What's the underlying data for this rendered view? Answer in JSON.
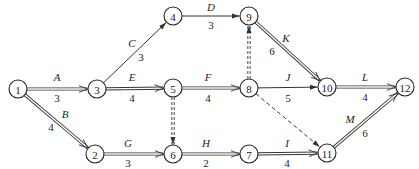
{
  "diagram": {
    "type": "activity-on-arrow network",
    "nodes": [
      {
        "id": "1",
        "x": 18,
        "y": 89
      },
      {
        "id": "2",
        "x": 95,
        "y": 154
      },
      {
        "id": "3",
        "x": 97,
        "y": 89
      },
      {
        "id": "4",
        "x": 173,
        "y": 16
      },
      {
        "id": "5",
        "x": 173,
        "y": 88
      },
      {
        "id": "6",
        "x": 173,
        "y": 154
      },
      {
        "id": "7",
        "x": 249,
        "y": 154
      },
      {
        "id": "8",
        "x": 249,
        "y": 88
      },
      {
        "id": "9",
        "x": 249,
        "y": 16
      },
      {
        "id": "10",
        "x": 327,
        "y": 87
      },
      {
        "id": "11",
        "x": 327,
        "y": 153
      },
      {
        "id": "12",
        "x": 405,
        "y": 87
      }
    ],
    "activities": [
      {
        "name": "A",
        "duration": "3",
        "from": "1",
        "to": "3",
        "style": "double",
        "name_pos": [
          57,
          81
        ],
        "dur_pos": [
          57,
          102
        ]
      },
      {
        "name": "B",
        "duration": "4",
        "from": "1",
        "to": "2",
        "style": "double",
        "name_pos": [
          65,
          118
        ],
        "dur_pos": [
          51,
          131
        ]
      },
      {
        "name": "C",
        "duration": "3",
        "from": "3",
        "to": "4",
        "style": "single",
        "name_pos": [
          132,
          47
        ],
        "dur_pos": [
          141,
          61
        ]
      },
      {
        "name": "D",
        "duration": "3",
        "from": "4",
        "to": "9",
        "style": "single",
        "name_pos": [
          211,
          11
        ],
        "dur_pos": [
          211,
          29
        ]
      },
      {
        "name": "E",
        "duration": "4",
        "from": "3",
        "to": "5",
        "style": "double",
        "name_pos": [
          132,
          81
        ],
        "dur_pos": [
          132,
          102
        ]
      },
      {
        "name": "F",
        "duration": "4",
        "from": "5",
        "to": "8",
        "style": "double",
        "name_pos": [
          208,
          81
        ],
        "dur_pos": [
          208,
          102
        ]
      },
      {
        "name": "G",
        "duration": "3",
        "from": "2",
        "to": "6",
        "style": "double",
        "name_pos": [
          128,
          147
        ],
        "dur_pos": [
          128,
          167
        ]
      },
      {
        "name": "H",
        "duration": "2",
        "from": "6",
        "to": "7",
        "style": "double",
        "name_pos": [
          206,
          147
        ],
        "dur_pos": [
          206,
          167
        ]
      },
      {
        "name": "I",
        "duration": "4",
        "from": "7",
        "to": "11",
        "style": "double",
        "name_pos": [
          287,
          147
        ],
        "dur_pos": [
          287,
          167
        ]
      },
      {
        "name": "J",
        "duration": "5",
        "from": "8",
        "to": "10",
        "style": "single",
        "name_pos": [
          288,
          81
        ],
        "dur_pos": [
          288,
          102
        ]
      },
      {
        "name": "K",
        "duration": "6",
        "from": "9",
        "to": "10",
        "style": "double",
        "name_pos": [
          286,
          42
        ],
        "dur_pos": [
          272,
          55
        ]
      },
      {
        "name": "L",
        "duration": "4",
        "from": "10",
        "to": "12",
        "style": "double",
        "name_pos": [
          365,
          81
        ],
        "dur_pos": [
          365,
          101
        ]
      },
      {
        "name": "M",
        "duration": "6",
        "from": "11",
        "to": "12",
        "style": "double",
        "name_pos": [
          350,
          123
        ],
        "dur_pos": [
          365,
          137
        ]
      }
    ],
    "dummies": [
      {
        "from": "5",
        "to": "6",
        "style": "double-dashed"
      },
      {
        "from": "8",
        "to": "9",
        "style": "double-dashed"
      },
      {
        "from": "8",
        "to": "11",
        "style": "single-dashed"
      }
    ],
    "node_radius": 9
  }
}
